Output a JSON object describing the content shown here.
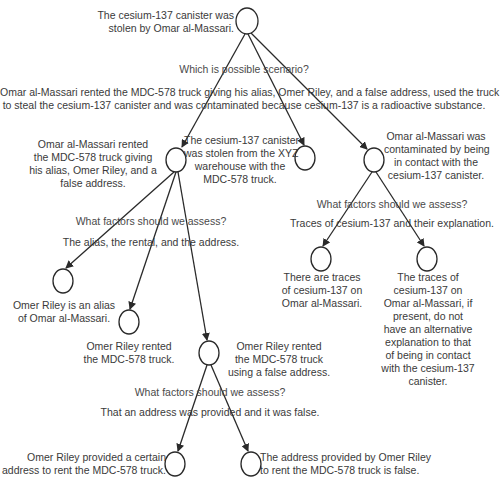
{
  "diagram": {
    "root": {
      "lines": [
        "The cesium-137 canister was",
        "stolen by Omar al-Massari."
      ]
    },
    "root_question": "Which is possible scenario?",
    "root_answer": [
      "Omar al-Massari rented the MDC-578 truck giving his alias, Omer Riley, and a false address, used the truck",
      "to steal the cesium-137 canister and was contaminated because cesium-137 is a radioactive substance."
    ],
    "rental_node": {
      "lines": [
        "Omar al-Massari rented",
        "the MDC-578 truck giving",
        "his alias, Omer Riley, and a",
        "false address."
      ]
    },
    "theft_node": {
      "lines": [
        "The cesium-137 canister",
        "was stolen from the XYZ",
        "warehouse with the",
        "MDC-578 truck."
      ]
    },
    "contamination_node": {
      "lines": [
        "Omar al-Massari was",
        "contaminated by being",
        "in contact with the",
        "cesium-137 canister."
      ]
    },
    "rental_question": "What factors should we assess?",
    "rental_answer": "The alias, the rental, and the address.",
    "contamination_question": "What factors should we assess?",
    "contamination_answer": "Traces of cesium-137 and their explanation.",
    "alias_node": {
      "lines": [
        "Omer Riley is an alias",
        "of Omar al-Massari."
      ]
    },
    "rented_node": {
      "lines": [
        "Omer Riley rented",
        "the MDC-578 truck."
      ]
    },
    "false_address_node": {
      "lines": [
        "Omer Riley rented",
        "the MDC-578 truck",
        "using a false address."
      ]
    },
    "traces_node": {
      "lines": [
        "There are traces",
        "of cesium-137 on",
        "Omar al-Massari."
      ]
    },
    "no_alt_node": {
      "lines": [
        "The traces of",
        "cesium-137 on",
        "Omar al-Massari, if",
        "present, do not",
        "have an alternative",
        "explanation  to that",
        "of being in contact",
        "with the cesium-137",
        "canister."
      ]
    },
    "address_question": "What factors should we assess?",
    "address_answer": "That an address was provided and it was false.",
    "provided_node": {
      "lines": [
        "Omer Riley provided a certain",
        "address to rent the MDC-578 truck."
      ]
    },
    "is_false_node": {
      "lines": [
        "The address provided by Omer Riley",
        "to rent the MDC-578 truck is false."
      ]
    },
    "colors": {
      "stroke": "#2a2a2a",
      "text": "#3a3a3a",
      "background": "#ffffff"
    }
  }
}
